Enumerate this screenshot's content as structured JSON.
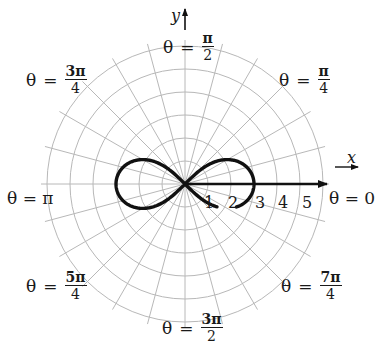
{
  "chart_data": {
    "type": "polar",
    "title": "",
    "curve": {
      "name": "lemniscate",
      "equation": "r^2 = 9 cos(2θ)",
      "max_r": 3,
      "color": "#111111"
    },
    "radial_ticks": [
      "1",
      "2",
      "3",
      "4",
      "5"
    ],
    "rings": [
      1,
      2,
      3,
      4,
      5,
      6
    ],
    "spokes_step_deg": 15,
    "grid": true,
    "grid_color": "#b8b8b8",
    "x_axis_label": "x",
    "y_axis_label": "y",
    "angle_labels": [
      {
        "id": "zero",
        "text": "θ = 0",
        "theta": "0"
      },
      {
        "id": "pi_4",
        "theta_pre": "θ",
        "eq": "=",
        "num": "π",
        "den": "4"
      },
      {
        "id": "pi_2",
        "theta_pre": "θ",
        "eq": "=",
        "num": "π",
        "den": "2"
      },
      {
        "id": "3pi_4",
        "theta_pre": "θ",
        "eq": "=",
        "num": "3π",
        "den": "4"
      },
      {
        "id": "pi",
        "text": "θ = π"
      },
      {
        "id": "5pi_4",
        "theta_pre": "θ",
        "eq": "=",
        "num": "5π",
        "den": "4"
      },
      {
        "id": "3pi_2",
        "theta_pre": "θ",
        "eq": "=",
        "num": "3π",
        "den": "2"
      },
      {
        "id": "7pi_4",
        "theta_pre": "θ",
        "eq": "=",
        "num": "7π",
        "den": "4"
      }
    ]
  }
}
